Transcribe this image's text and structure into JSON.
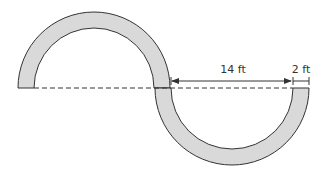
{
  "diagram": {
    "shape": "S-curve path made of two semicircular bands",
    "labels": {
      "inner_width": "14 ft",
      "band_width": "2 ft"
    },
    "colors": {
      "band_fill": "#d9d9d9",
      "stroke": "#333333",
      "dashed_line": "#333333"
    }
  }
}
